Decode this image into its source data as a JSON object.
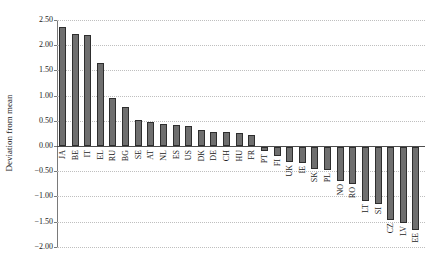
{
  "chart_data": {
    "type": "bar",
    "title": "",
    "ylabel": "Deviation from mean",
    "xlabel": "",
    "categories": [
      "JA",
      "BE",
      "IT",
      "EL",
      "RU",
      "BG",
      "SE",
      "AT",
      "NL",
      "ES",
      "US",
      "DK",
      "DE",
      "CH",
      "HU",
      "FR",
      "PT",
      "FI",
      "UK",
      "IE",
      "SK",
      "PL",
      "NO",
      "RO",
      "LT",
      "SI",
      "CZ",
      "LV",
      "EE"
    ],
    "values": [
      2.37,
      2.23,
      2.2,
      1.64,
      0.95,
      0.78,
      0.51,
      0.47,
      0.43,
      0.41,
      0.4,
      0.31,
      0.28,
      0.27,
      0.26,
      0.21,
      -0.08,
      -0.17,
      -0.29,
      -0.32,
      -0.43,
      -0.46,
      -0.68,
      -0.74,
      -1.07,
      -1.13,
      -1.45,
      -1.51,
      -1.65
    ],
    "ylim": [
      -2.0,
      2.5
    ],
    "ytick_step": 0.5,
    "ytick_labels": [
      "2.50",
      "2.00",
      "1.50",
      "1.00",
      "0.50",
      "0.00",
      "−0.50",
      "−1.00",
      "−1.50",
      "−2.00"
    ],
    "ytick_values": [
      2.5,
      2.0,
      1.5,
      1.0,
      0.5,
      0.0,
      -0.5,
      -1.0,
      -1.5,
      -2.0
    ],
    "grid": "horizontal-dotted",
    "legend": "none",
    "label_style": "rotated-90-follows-bar-end",
    "colors": {
      "bar_fill": "#6f6f6f",
      "bar_border": "#2e2e2e",
      "gridline": "#bfbfbf",
      "axis": "#7a7a7a",
      "zero_line": "#4d4d4d",
      "text": "#1a1a1a",
      "background": "#ffffff"
    }
  }
}
